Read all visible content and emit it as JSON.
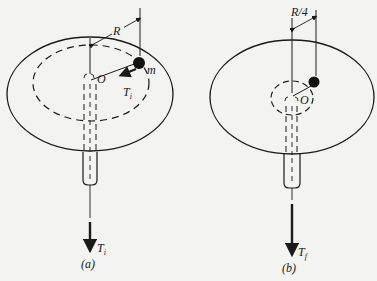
{
  "figure": {
    "background": "#f3f3f1",
    "ink": "#1a1a1a",
    "panels": [
      {
        "id": "a",
        "caption": "(a)",
        "radius_label": "R",
        "mass_label": "m",
        "center_label": "O",
        "tension_label": "T",
        "tension_subscript": "i",
        "bottom_tension_label": "T",
        "bottom_tension_subscript": "i"
      },
      {
        "id": "b",
        "caption": "(b)",
        "radius_label": "R/4",
        "center_label": "O",
        "bottom_tension_label": "T",
        "bottom_tension_subscript": "f"
      }
    ]
  }
}
